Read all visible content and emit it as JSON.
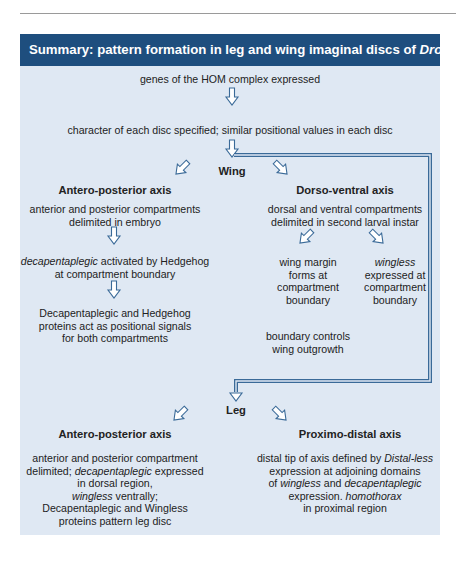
{
  "header": {
    "title_prefix": "Summary: pattern formation in leg and wing imaginal discs of ",
    "title_italic": "Drosophila"
  },
  "colors": {
    "header_bg": "#1e4e7e",
    "box_bg": "#dfe8f3",
    "arrow_stroke": "#3a6a98"
  },
  "top": {
    "step1": "genes of the HOM complex expressed",
    "step2": "character of each disc specified; similar positional values in each disc"
  },
  "wing": {
    "label": "Wing",
    "ap": {
      "title": "Antero-posterior axis",
      "step1_l1": "anterior and posterior compartments",
      "step1_l2": "delimited in embryo",
      "step2_l1_italic": "decapentaplegic",
      "step2_l1_rest": " activated by Hedgehog",
      "step2_l2": "at compartment boundary",
      "step3_l1": "Decapentaplegic and Hedgehog",
      "step3_l2": "proteins act as positional signals",
      "step3_l3": "for both compartments"
    },
    "dv": {
      "title": "Dorso-ventral axis",
      "step1_l1": "dorsal and ventral compartments",
      "step1_l2": "delimited in second larval instar",
      "left_l1": "wing margin",
      "left_l2": "forms at",
      "left_l3": "compartment",
      "left_l4": "boundary",
      "right_l1_italic": "wingless",
      "right_l2": "expressed at",
      "right_l3": "compartment",
      "right_l4": "boundary",
      "bottom_l1": "boundary controls",
      "bottom_l2": "wing outgrowth"
    }
  },
  "leg": {
    "label": "Leg",
    "ap": {
      "title": "Antero-posterior axis",
      "l1": "anterior and posterior compartment",
      "l2_a": "delimited; ",
      "l2_italic": "decapentaplegic",
      "l2_b": " expressed",
      "l3": "in dorsal region,",
      "l4_italic": "wingless",
      "l4_b": " ventrally;",
      "l5": "Decapentaplegic and Wingless",
      "l6": "proteins pattern leg disc"
    },
    "pd": {
      "title": "Proximo-distal axis",
      "l1_a": "distal tip of axis defined by ",
      "l1_italic": "Distal-less",
      "l2": "expression at adjoining domains",
      "l3_a": "of ",
      "l3_italic1": "wingless",
      "l3_b": " and ",
      "l3_italic2": "decapentaplegic",
      "l4_a": "expression. ",
      "l4_italic": "homothorax",
      "l5": "in proximal region"
    }
  }
}
